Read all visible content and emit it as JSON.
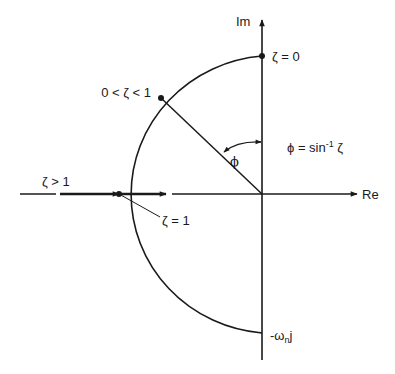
{
  "diagram": {
    "type": "s-plane damping ratio locus",
    "axes": {
      "imaginary_label": "Im",
      "real_label": "Re"
    },
    "points": {
      "zeta_zero": "ζ = 0",
      "zeta_between": "0 < ζ < 1",
      "zeta_one": "ζ = 1",
      "zeta_greater": "ζ > 1",
      "bottom": "-ω",
      "bottom_sub": "n",
      "bottom_suffix": "j"
    },
    "angle": {
      "symbol": "ϕ",
      "formula_lhs": "ϕ = sin",
      "formula_exp": "-1",
      "formula_rhs": " ζ"
    },
    "colors": {
      "line": "#1a1a1a",
      "background": "#ffffff"
    }
  }
}
